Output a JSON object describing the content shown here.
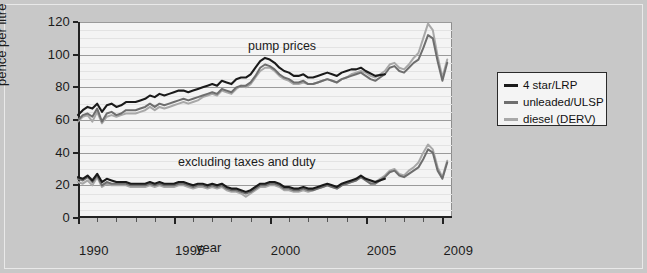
{
  "chart_data": {
    "type": "line",
    "title": "",
    "xlabel": "year",
    "ylabel": "pence per litre",
    "xlim": [
      1990,
      2009.5
    ],
    "ylim": [
      0,
      120
    ],
    "grid": true,
    "legend_position": "right-outside",
    "y_ticks": [
      0,
      20,
      40,
      60,
      80,
      100,
      120
    ],
    "x_ticks": [
      1990,
      1995,
      2000,
      2005,
      2009
    ],
    "x_minor_tick_interval": 1,
    "annotations": [
      {
        "text": "pump prices",
        "x": 1998.2,
        "y": 104
      },
      {
        "text": "excluding taxes and duty",
        "x": 1994.4,
        "y": 35
      }
    ],
    "series": [
      {
        "name": "4 star/LRP",
        "color": "#1a1a1a",
        "group": "pump prices",
        "x": [
          1990.0,
          1990.25,
          1990.5,
          1990.75,
          1991.0,
          1991.25,
          1991.5,
          1991.75,
          1992.0,
          1992.25,
          1992.5,
          1992.75,
          1993.0,
          1993.25,
          1993.5,
          1993.75,
          1994.0,
          1994.25,
          1994.5,
          1994.75,
          1995.0,
          1995.25,
          1995.5,
          1995.75,
          1996.0,
          1996.25,
          1996.5,
          1996.75,
          1997.0,
          1997.25,
          1997.5,
          1997.75,
          1998.0,
          1998.25,
          1998.5,
          1998.75,
          1999.0,
          1999.25,
          1999.5,
          1999.75,
          2000.0,
          2000.25,
          2000.5,
          2000.75,
          2001.0,
          2001.25,
          2001.5,
          2001.75,
          2002.0,
          2002.25,
          2002.5,
          2002.75,
          2003.0,
          2003.25,
          2003.5,
          2003.75,
          2004.0,
          2004.25,
          2004.5,
          2004.75,
          2005.0,
          2005.5,
          2006.0
        ],
        "y": [
          63,
          66,
          68,
          67,
          70,
          65,
          69,
          70,
          68,
          69,
          71,
          71,
          71,
          72,
          73,
          75,
          74,
          76,
          75,
          76,
          77,
          78,
          78,
          77,
          78,
          79,
          80,
          81,
          82,
          81,
          84,
          83,
          82,
          85,
          86,
          86,
          88,
          92,
          96,
          98,
          97,
          95,
          92,
          90,
          89,
          87,
          87,
          88,
          86,
          86,
          87,
          88,
          89,
          88,
          87,
          89,
          90,
          91,
          91,
          92,
          90,
          87,
          88
        ]
      },
      {
        "name": "unleaded/ULSP",
        "color": "#6e6e6e",
        "group": "pump prices",
        "x": [
          1990.0,
          1990.25,
          1990.5,
          1990.75,
          1991.0,
          1991.25,
          1991.5,
          1991.75,
          1992.0,
          1992.25,
          1992.5,
          1992.75,
          1993.0,
          1993.25,
          1993.5,
          1993.75,
          1994.0,
          1994.25,
          1994.5,
          1994.75,
          1995.0,
          1995.25,
          1995.5,
          1995.75,
          1996.0,
          1996.25,
          1996.5,
          1996.75,
          1997.0,
          1997.25,
          1997.5,
          1997.75,
          1998.0,
          1998.25,
          1998.5,
          1998.75,
          1999.0,
          1999.25,
          1999.5,
          1999.75,
          2000.0,
          2000.25,
          2000.5,
          2000.75,
          2001.0,
          2001.25,
          2001.5,
          2001.75,
          2002.0,
          2002.25,
          2002.5,
          2002.75,
          2003.0,
          2003.25,
          2003.5,
          2003.75,
          2004.0,
          2004.25,
          2004.5,
          2004.75,
          2005.0,
          2005.25,
          2005.5,
          2005.75,
          2006.0,
          2006.25,
          2006.5,
          2006.75,
          2007.0,
          2007.25,
          2007.5,
          2007.75,
          2008.0,
          2008.25,
          2008.5,
          2008.75,
          2009.0,
          2009.25
        ],
        "y": [
          60,
          63,
          64,
          62,
          67,
          59,
          64,
          65,
          63,
          64,
          66,
          66,
          66,
          67,
          68,
          70,
          68,
          70,
          69,
          70,
          71,
          72,
          73,
          72,
          73,
          74,
          75,
          76,
          77,
          76,
          79,
          78,
          77,
          80,
          81,
          81,
          83,
          87,
          92,
          94,
          93,
          91,
          88,
          86,
          85,
          83,
          83,
          84,
          82,
          82,
          83,
          84,
          85,
          84,
          83,
          85,
          86,
          87,
          88,
          89,
          87,
          85,
          84,
          86,
          88,
          92,
          93,
          90,
          89,
          92,
          95,
          97,
          104,
          112,
          110,
          96,
          84,
          95
        ]
      },
      {
        "name": "diesel (DERV)",
        "color": "#a8a8a8",
        "group": "pump prices",
        "x": [
          1990.0,
          1990.25,
          1990.5,
          1990.75,
          1991.0,
          1991.25,
          1991.5,
          1991.75,
          1992.0,
          1992.25,
          1992.5,
          1992.75,
          1993.0,
          1993.25,
          1993.5,
          1993.75,
          1994.0,
          1994.25,
          1994.5,
          1994.75,
          1995.0,
          1995.25,
          1995.5,
          1995.75,
          1996.0,
          1996.25,
          1996.5,
          1996.75,
          1997.0,
          1997.25,
          1997.5,
          1997.75,
          1998.0,
          1998.25,
          1998.5,
          1998.75,
          1999.0,
          1999.25,
          1999.5,
          1999.75,
          2000.0,
          2000.25,
          2000.5,
          2000.75,
          2001.0,
          2001.25,
          2001.5,
          2001.75,
          2002.0,
          2002.25,
          2002.5,
          2002.75,
          2003.0,
          2003.25,
          2003.5,
          2003.75,
          2004.0,
          2004.25,
          2004.5,
          2004.75,
          2005.0,
          2005.25,
          2005.5,
          2005.75,
          2006.0,
          2006.25,
          2006.5,
          2006.75,
          2007.0,
          2007.25,
          2007.5,
          2007.75,
          2008.0,
          2008.25,
          2008.5,
          2008.75,
          2009.0,
          2009.25
        ],
        "y": [
          59,
          62,
          63,
          59,
          65,
          58,
          62,
          63,
          62,
          63,
          64,
          64,
          64,
          65,
          66,
          68,
          66,
          68,
          67,
          68,
          69,
          70,
          71,
          70,
          71,
          72,
          74,
          75,
          76,
          75,
          78,
          77,
          76,
          79,
          81,
          80,
          82,
          86,
          90,
          92,
          92,
          90,
          87,
          85,
          84,
          82,
          82,
          83,
          82,
          82,
          83,
          84,
          85,
          84,
          83,
          85,
          86,
          88,
          89,
          90,
          89,
          87,
          86,
          88,
          90,
          94,
          95,
          92,
          91,
          94,
          98,
          101,
          110,
          119,
          115,
          99,
          86,
          97
        ]
      },
      {
        "name": "4 star/LRP",
        "color": "#1a1a1a",
        "group": "excluding taxes and duty",
        "x": [
          1990.0,
          1990.25,
          1990.5,
          1990.75,
          1991.0,
          1991.25,
          1991.5,
          1991.75,
          1992.0,
          1992.25,
          1992.5,
          1992.75,
          1993.0,
          1993.25,
          1993.5,
          1993.75,
          1994.0,
          1994.25,
          1994.5,
          1994.75,
          1995.0,
          1995.25,
          1995.5,
          1995.75,
          1996.0,
          1996.25,
          1996.5,
          1996.75,
          1997.0,
          1997.25,
          1997.5,
          1997.75,
          1998.0,
          1998.25,
          1998.5,
          1998.75,
          1999.0,
          1999.25,
          1999.5,
          1999.75,
          2000.0,
          2000.25,
          2000.5,
          2000.75,
          2001.0,
          2001.25,
          2001.5,
          2001.75,
          2002.0,
          2002.25,
          2002.5,
          2002.75,
          2003.0,
          2003.25,
          2003.5,
          2003.75,
          2004.0,
          2004.25,
          2004.5,
          2004.75,
          2005.0,
          2005.5,
          2006.0
        ],
        "y": [
          25,
          24,
          26,
          23,
          27,
          22,
          24,
          23,
          22,
          22,
          22,
          21,
          21,
          21,
          21,
          22,
          21,
          22,
          21,
          21,
          21,
          22,
          22,
          21,
          20,
          21,
          21,
          20,
          21,
          20,
          21,
          19,
          18,
          18,
          17,
          16,
          17,
          19,
          21,
          21,
          22,
          22,
          21,
          19,
          19,
          18,
          18,
          19,
          18,
          18,
          19,
          20,
          21,
          20,
          19,
          21,
          22,
          23,
          24,
          26,
          24,
          22,
          24
        ]
      },
      {
        "name": "unleaded/ULSP",
        "color": "#6e6e6e",
        "group": "excluding taxes and duty",
        "x": [
          1990.0,
          1990.25,
          1990.5,
          1990.75,
          1991.0,
          1991.25,
          1991.5,
          1991.75,
          1992.0,
          1992.25,
          1992.5,
          1992.75,
          1993.0,
          1993.25,
          1993.5,
          1993.75,
          1994.0,
          1994.25,
          1994.5,
          1994.75,
          1995.0,
          1995.25,
          1995.5,
          1995.75,
          1996.0,
          1996.25,
          1996.5,
          1996.75,
          1997.0,
          1997.25,
          1997.5,
          1997.75,
          1998.0,
          1998.25,
          1998.5,
          1998.75,
          1999.0,
          1999.25,
          1999.5,
          1999.75,
          2000.0,
          2000.25,
          2000.5,
          2000.75,
          2001.0,
          2001.25,
          2001.5,
          2001.75,
          2002.0,
          2002.25,
          2002.5,
          2002.75,
          2003.0,
          2003.25,
          2003.5,
          2003.75,
          2004.0,
          2004.25,
          2004.5,
          2004.75,
          2005.0,
          2005.25,
          2005.5,
          2005.75,
          2006.0,
          2006.25,
          2006.5,
          2006.75,
          2007.0,
          2007.25,
          2007.5,
          2007.75,
          2008.0,
          2008.25,
          2008.5,
          2008.75,
          2009.0,
          2009.25
        ],
        "y": [
          24,
          23,
          25,
          22,
          26,
          20,
          22,
          21,
          21,
          21,
          21,
          20,
          20,
          20,
          20,
          21,
          20,
          21,
          20,
          20,
          20,
          21,
          21,
          20,
          19,
          20,
          20,
          19,
          20,
          19,
          20,
          18,
          17,
          17,
          16,
          15,
          16,
          18,
          20,
          20,
          21,
          21,
          20,
          18,
          18,
          17,
          17,
          18,
          17,
          17,
          18,
          19,
          20,
          19,
          18,
          20,
          21,
          22,
          23,
          25,
          23,
          21,
          21,
          23,
          25,
          28,
          29,
          26,
          25,
          27,
          29,
          31,
          36,
          42,
          40,
          29,
          24,
          34
        ]
      },
      {
        "name": "diesel (DERV)",
        "color": "#a8a8a8",
        "group": "excluding taxes and duty",
        "x": [
          1990.0,
          1990.25,
          1990.5,
          1990.75,
          1991.0,
          1991.25,
          1991.5,
          1991.75,
          1992.0,
          1992.25,
          1992.5,
          1992.75,
          1993.0,
          1993.25,
          1993.5,
          1993.75,
          1994.0,
          1994.25,
          1994.5,
          1994.75,
          1995.0,
          1995.25,
          1995.5,
          1995.75,
          1996.0,
          1996.25,
          1996.5,
          1996.75,
          1997.0,
          1997.25,
          1997.5,
          1997.75,
          1998.0,
          1998.25,
          1998.5,
          1998.75,
          1999.0,
          1999.25,
          1999.5,
          1999.75,
          2000.0,
          2000.25,
          2000.5,
          2000.75,
          2001.0,
          2001.25,
          2001.5,
          2001.75,
          2002.0,
          2002.25,
          2002.5,
          2002.75,
          2003.0,
          2003.25,
          2003.5,
          2003.75,
          2004.0,
          2004.25,
          2004.5,
          2004.75,
          2005.0,
          2005.25,
          2005.5,
          2005.75,
          2006.0,
          2006.25,
          2006.5,
          2006.75,
          2007.0,
          2007.25,
          2007.5,
          2007.75,
          2008.0,
          2008.25,
          2008.5,
          2008.75,
          2009.0,
          2009.25
        ],
        "y": [
          22,
          21,
          23,
          20,
          25,
          19,
          21,
          20,
          20,
          20,
          20,
          19,
          19,
          19,
          19,
          20,
          19,
          20,
          19,
          19,
          19,
          20,
          20,
          19,
          18,
          19,
          19,
          18,
          19,
          18,
          19,
          17,
          16,
          16,
          15,
          13,
          15,
          17,
          19,
          19,
          20,
          20,
          19,
          17,
          17,
          16,
          16,
          17,
          16,
          17,
          18,
          19,
          20,
          19,
          18,
          20,
          21,
          22,
          23,
          25,
          24,
          22,
          22,
          24,
          26,
          29,
          30,
          27,
          26,
          29,
          31,
          34,
          40,
          45,
          42,
          31,
          25,
          35
        ]
      }
    ]
  },
  "legend": {
    "items": [
      {
        "label": "4 star/LRP",
        "color": "#1a1a1a"
      },
      {
        "label": "unleaded/ULSP",
        "color": "#6e6e6e"
      },
      {
        "label": "diesel (DERV)",
        "color": "#a8a8a8"
      }
    ]
  },
  "axes": {
    "y_label": "pence per litre",
    "x_label": "year",
    "y_ticks": [
      "120",
      "100",
      "80",
      "60",
      "40",
      "20",
      "0"
    ],
    "x_ticks": [
      "1990",
      "1995",
      "2000",
      "2005",
      "2009"
    ]
  },
  "annotations": {
    "upper": "pump prices",
    "lower": "excluding taxes and duty"
  }
}
